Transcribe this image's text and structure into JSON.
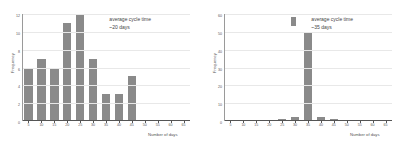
{
  "chart_data": [
    {
      "id": "left",
      "type": "bar",
      "title": "",
      "xlabel": "Number of days",
      "ylabel": "Frequency",
      "categories": [
        5,
        10,
        15,
        20,
        25,
        30,
        35,
        40,
        45,
        50,
        55,
        60,
        65
      ],
      "values": [
        6,
        7,
        6,
        11,
        12,
        7,
        3,
        3,
        5,
        0,
        0,
        0,
        0
      ],
      "xticks": [
        5,
        10,
        15,
        20,
        25,
        30,
        35,
        40,
        45,
        50,
        55,
        60,
        65
      ],
      "yticks": [
        0,
        2,
        4,
        6,
        8,
        10,
        12
      ],
      "ylim": [
        0,
        12
      ],
      "xlim": [
        2.5,
        67.5
      ],
      "grid": true,
      "legend": "none",
      "bar_color": "#8a8a8a",
      "annotation": {
        "line1": "average cycle time",
        "line2": "~20 days"
      }
    },
    {
      "id": "right",
      "type": "bar",
      "title": "",
      "xlabel": "Number of days",
      "ylabel": "Frequency",
      "categories": [
        5,
        10,
        15,
        20,
        25,
        30,
        35,
        40,
        45,
        50,
        55,
        60,
        65
      ],
      "values": [
        0,
        0,
        0,
        0,
        1,
        2,
        50,
        2,
        1,
        0,
        0,
        0,
        0
      ],
      "xticks": [
        5,
        10,
        15,
        20,
        25,
        30,
        35,
        40,
        45,
        50,
        55,
        60,
        65
      ],
      "yticks": [
        0,
        10,
        20,
        30,
        40,
        50,
        60
      ],
      "ylim": [
        0,
        60
      ],
      "xlim": [
        2.5,
        67.5
      ],
      "grid": true,
      "legend": "swatch",
      "bar_color": "#8a8a8a",
      "annotation": {
        "line1": "average cycle time",
        "line2": "~35 days"
      }
    }
  ]
}
